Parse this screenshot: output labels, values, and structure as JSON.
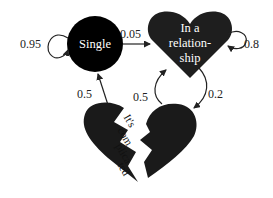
{
  "diagram": {
    "type": "markov-chain",
    "states": [
      {
        "id": "single",
        "shape": "circle",
        "label": "Single",
        "color": "#000000"
      },
      {
        "id": "relationship",
        "shape": "heart",
        "label_lines": [
          "In a",
          "relation-",
          "ship"
        ],
        "color": "#1e1e1e"
      },
      {
        "id": "complicated",
        "shape": "broken-heart",
        "label_lines": [
          "It's",
          "com",
          "plica",
          "ted"
        ],
        "color": "#1a1a1a"
      }
    ],
    "transitions": [
      {
        "from": "single",
        "to": "single",
        "label": "0.95"
      },
      {
        "from": "single",
        "to": "relationship",
        "label": "0.05"
      },
      {
        "from": "relationship",
        "to": "relationship",
        "label": "0.8"
      },
      {
        "from": "relationship",
        "to": "complicated",
        "label": "0.2"
      },
      {
        "from": "complicated",
        "to": "relationship",
        "label": "0.5"
      },
      {
        "from": "complicated",
        "to": "single",
        "label": "0.5"
      }
    ]
  }
}
